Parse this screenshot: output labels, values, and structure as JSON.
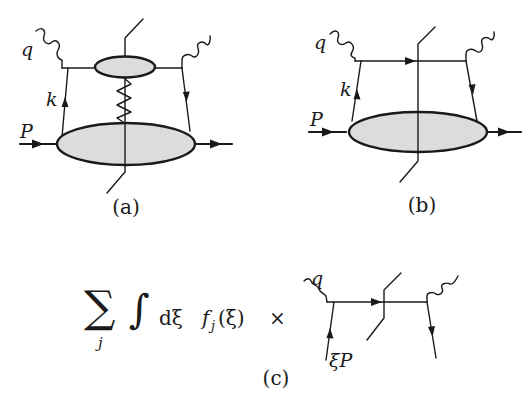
{
  "figure": {
    "panels": [
      {
        "id": "a",
        "caption": "(a)",
        "labels": {
          "photon": "q",
          "parton": "k",
          "proton": "P"
        },
        "description": "Forward amplitude with hadron blob, hard subgraph blob and exchanged zigzag line, cut vertically"
      },
      {
        "id": "b",
        "caption": "(b)",
        "labels": {
          "photon": "q",
          "parton": "k",
          "proton": "P"
        },
        "description": "Handbag diagram: parton k from hadron blob absorbs photon q, cut through struck quark"
      },
      {
        "id": "c",
        "caption": "(c)",
        "formula": {
          "sum_symbol": "∑",
          "sum_index": "j",
          "integral_symbol": "∫",
          "measure": "dξ",
          "pdf": "f",
          "pdf_index": "j",
          "pdf_argument": "(ξ)",
          "times": "×"
        },
        "labels": {
          "photon": "q",
          "parton": "ξP"
        },
        "description": "Parton-model factorization: sum over partons j of integral over momentum fraction of PDF times partonic cut diagram"
      }
    ]
  }
}
